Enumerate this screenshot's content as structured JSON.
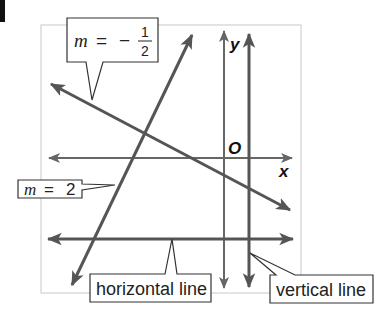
{
  "corner_mark": {
    "color": "#111111"
  },
  "graph": {
    "frame_color": "#c8c8c8",
    "line_color": "#555555",
    "axis_color": "#666666",
    "axes": {
      "x_label": "x",
      "y_label": "y",
      "origin_label": "O"
    }
  },
  "lines": [
    {
      "name": "slope-negative-half",
      "description": "line with slope -1/2"
    },
    {
      "name": "slope-two",
      "description": "line with slope 2"
    },
    {
      "name": "horizontal",
      "description": "horizontal line"
    },
    {
      "name": "vertical",
      "description": "vertical line"
    }
  ],
  "callouts": {
    "neg_half": {
      "var": "m",
      "eq": "=",
      "sign": "−",
      "numerator": "1",
      "denominator": "2"
    },
    "two": {
      "var": "m",
      "eq": "=",
      "value": "2"
    },
    "horizontal": {
      "label": "horizontal line"
    },
    "vertical": {
      "label": "vertical line"
    }
  }
}
